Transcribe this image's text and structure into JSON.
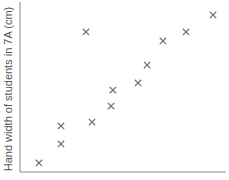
{
  "chart_data": {
    "type": "scatter",
    "title": "",
    "xlabel": "",
    "ylabel": "Hand width of students in 7A (cm)",
    "marker": "x",
    "marker_color": "#707070",
    "axis_color": "#8a8a8a",
    "grid": false,
    "x_ticks": [],
    "y_ticks": [],
    "xlim": [
      0,
      100
    ],
    "ylim": [
      0,
      100
    ],
    "note": "Axes have no tick labels; values are relative positions within the plot area (0-100).",
    "points": [
      {
        "x": 9.2,
        "y": 5.3
      },
      {
        "x": 19.9,
        "y": 16.5
      },
      {
        "x": 19.9,
        "y": 27.1
      },
      {
        "x": 32.0,
        "y": 82.4
      },
      {
        "x": 35.0,
        "y": 29.4
      },
      {
        "x": 44.2,
        "y": 38.8
      },
      {
        "x": 45.1,
        "y": 48.2
      },
      {
        "x": 57.3,
        "y": 52.4
      },
      {
        "x": 61.7,
        "y": 62.9
      },
      {
        "x": 69.4,
        "y": 77.1
      },
      {
        "x": 80.6,
        "y": 82.4
      },
      {
        "x": 93.7,
        "y": 92.4
      }
    ]
  }
}
